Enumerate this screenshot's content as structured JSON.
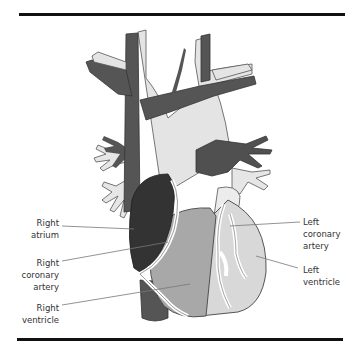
{
  "diagram": {
    "colors": {
      "dark_vessel": "#555555",
      "light_vessel": "#e2e2e2",
      "right_atrium": "#333333",
      "right_ventricle": "#a9a9a9",
      "left_ventricle": "#d9d9d9",
      "coronary": "#ffffff",
      "outline": "#444444",
      "rule": "#111111"
    },
    "labels": {
      "right_atrium": [
        "Right",
        "atrium"
      ],
      "right_coronary_artery": [
        "Right",
        "coronary",
        "artery"
      ],
      "right_ventricle": [
        "Right",
        "ventricle"
      ],
      "left_coronary_artery": [
        "Left",
        "coronary",
        "artery"
      ],
      "left_ventricle": [
        "Left",
        "ventricle"
      ]
    }
  }
}
